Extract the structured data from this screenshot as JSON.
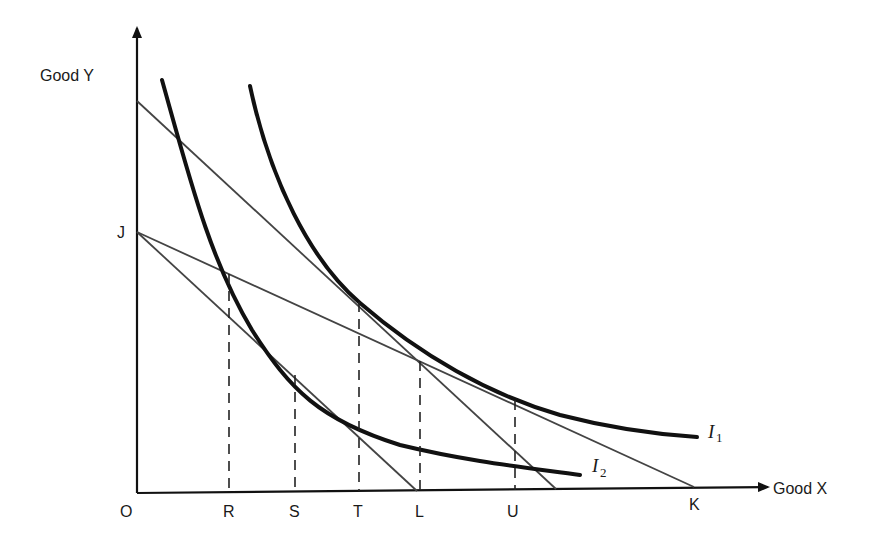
{
  "diagram": {
    "title": "",
    "axes": {
      "y_label": "Good Y",
      "x_label": "Good X",
      "origin_label": "O"
    },
    "x_axis_points": [
      {
        "id": "R",
        "label": "R"
      },
      {
        "id": "S",
        "label": "S"
      },
      {
        "id": "T",
        "label": "T"
      },
      {
        "id": "L",
        "label": "L"
      },
      {
        "id": "U",
        "label": "U"
      },
      {
        "id": "K",
        "label": "K"
      }
    ],
    "y_axis_points": [
      {
        "id": "J",
        "label": "J"
      }
    ],
    "curves": [
      {
        "id": "I1",
        "label": "I",
        "subscript": "1",
        "type": "indifference-curve"
      },
      {
        "id": "I2",
        "label": "I",
        "subscript": "2",
        "type": "indifference-curve"
      }
    ],
    "budget_lines": [
      {
        "id": "upper-budget-line",
        "description": "steep line from upper Y intercept tangent to I1 at T"
      },
      {
        "id": "JL",
        "description": "line J to L tangent to I2 at S"
      },
      {
        "id": "JK",
        "description": "line J to K tangent to I1 at U, crossing I2 at R"
      }
    ],
    "dashed_guides": [
      "R",
      "S",
      "T",
      "L",
      "U"
    ]
  }
}
